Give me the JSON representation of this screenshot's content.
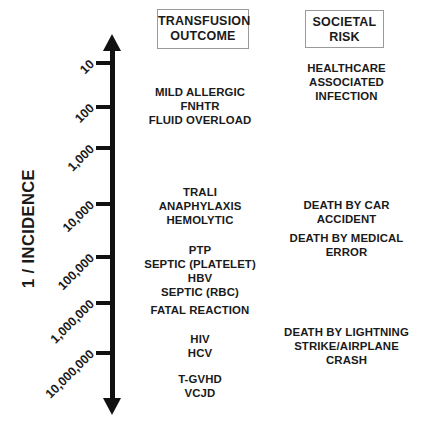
{
  "axis": {
    "title": "1 / INCIDENCE",
    "ticks": [
      {
        "label": "10",
        "y": 63
      },
      {
        "label": "100",
        "y": 107
      },
      {
        "label": "1,000",
        "y": 148
      },
      {
        "label": "10,000",
        "y": 204
      },
      {
        "label": "100,000",
        "y": 257
      },
      {
        "label": "1,000,000",
        "y": 303
      },
      {
        "label": "10,000,000",
        "y": 353
      }
    ]
  },
  "columns": {
    "transfusion": {
      "header_line1": "TRANSFUSION",
      "header_line2": "OUTCOME",
      "groups": [
        {
          "top": 85,
          "lines": [
            "MILD ALLERGIC",
            "FNHTR",
            "FLUID OVERLOAD"
          ]
        },
        {
          "top": 185,
          "lines": [
            "TRALI",
            "ANAPHYLAXIS",
            "HEMOLYTIC"
          ]
        },
        {
          "top": 243,
          "lines": [
            "PTP",
            "SEPTIC (PLATELET)",
            "HBV",
            "SEPTIC (RBC)"
          ]
        },
        {
          "top": 303,
          "lines": [
            "FATAL REACTION"
          ]
        },
        {
          "top": 332,
          "lines": [
            "HIV",
            "HCV"
          ]
        },
        {
          "top": 372,
          "lines": [
            "T-GVHD",
            "VCJD"
          ]
        }
      ]
    },
    "societal": {
      "header_line1": "SOCIETAL",
      "header_line2": "RISK",
      "groups": [
        {
          "top": 61,
          "lines": [
            "HEALTHCARE",
            "ASSOCIATED",
            "INFECTION"
          ]
        },
        {
          "top": 198,
          "lines": [
            "DEATH BY CAR",
            "ACCIDENT"
          ]
        },
        {
          "top": 231,
          "lines": [
            "DEATH BY MEDICAL",
            "ERROR"
          ]
        },
        {
          "top": 325,
          "lines": [
            "DEATH BY LIGHTNING",
            "STRIKE/AIRPLANE",
            "CRASH"
          ]
        }
      ]
    }
  },
  "colors": {
    "ink": "#111111",
    "box_border": "#9a9a9a",
    "background": "#ffffff"
  }
}
